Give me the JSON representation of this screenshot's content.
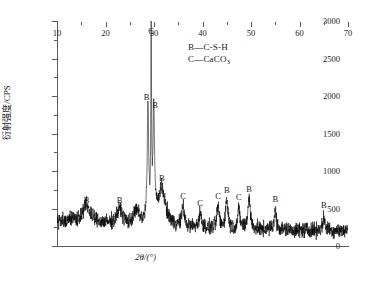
{
  "chart_data": {
    "type": "line",
    "title": "",
    "xlabel": "2θ/(°)",
    "ylabel": "衍射强度/CPS",
    "xlim": [
      10,
      70
    ],
    "ylim": [
      0,
      3000
    ],
    "x_ticks": [
      10,
      20,
      30,
      40,
      50,
      60,
      70
    ],
    "x_tick_labels": [
      "10",
      "20",
      "30",
      "40",
      "50",
      "60",
      "70"
    ],
    "x_minor_step": 5,
    "y_ticks": [
      0,
      500,
      1000,
      1500,
      2000,
      2500,
      3000
    ],
    "y_tick_labels": [
      "0",
      "500",
      "1000",
      "1500",
      "2000",
      "2500",
      "3000"
    ],
    "y_minor_step": 250,
    "grid": false,
    "legend_position": "top-center",
    "legend": [
      {
        "symbol": "B",
        "dash": "—",
        "name": "C-S-H"
      },
      {
        "symbol": "C",
        "dash": "—",
        "name": "CaCO3",
        "name_base": "CaCO",
        "name_sub": "3"
      }
    ],
    "series_name": "XRD pattern",
    "series_color": "#000000",
    "baseline_cps": 210,
    "noise_amplitude_cps": 70,
    "peaks": [
      {
        "two_theta": 16.1,
        "intensity": 430,
        "label": "B",
        "label_two_theta": 16.1,
        "label_cps": 560
      },
      {
        "two_theta": 22.9,
        "intensity": 420,
        "label": "B",
        "label_two_theta": 22.9,
        "label_cps": 560
      },
      {
        "two_theta": 26.4,
        "intensity": 390,
        "label": "",
        "label_two_theta": null,
        "label_cps": null
      },
      {
        "two_theta": 28.75,
        "intensity": 1760,
        "label": "B",
        "label_two_theta": 28.45,
        "label_cps": 1930
      },
      {
        "two_theta": 29.42,
        "intensity": 2650,
        "label": "C",
        "label_two_theta": 29.42,
        "label_cps": 2820
      },
      {
        "two_theta": 29.95,
        "intensity": 1700,
        "label": "B",
        "label_two_theta": 30.25,
        "label_cps": 1830
      },
      {
        "two_theta": 31.6,
        "intensity": 700,
        "label": "B",
        "label_two_theta": 31.6,
        "label_cps": 860
      },
      {
        "two_theta": 36.0,
        "intensity": 470,
        "label": "C",
        "label_two_theta": 36.0,
        "label_cps": 620
      },
      {
        "two_theta": 39.5,
        "intensity": 400,
        "label": "C",
        "label_two_theta": 39.5,
        "label_cps": 520
      },
      {
        "two_theta": 43.2,
        "intensity": 480,
        "label": "C",
        "label_two_theta": 43.2,
        "label_cps": 620
      },
      {
        "two_theta": 45.0,
        "intensity": 600,
        "label": "B",
        "label_two_theta": 45.0,
        "label_cps": 700
      },
      {
        "two_theta": 47.5,
        "intensity": 450,
        "label": "C",
        "label_two_theta": 47.5,
        "label_cps": 600
      },
      {
        "two_theta": 49.6,
        "intensity": 630,
        "label": "B",
        "label_two_theta": 49.6,
        "label_cps": 710
      },
      {
        "two_theta": 55.0,
        "intensity": 460,
        "label": "B",
        "label_two_theta": 55.0,
        "label_cps": 580
      },
      {
        "two_theta": 65.0,
        "intensity": 360,
        "label": "B",
        "label_two_theta": 65.0,
        "label_cps": 500
      }
    ]
  }
}
